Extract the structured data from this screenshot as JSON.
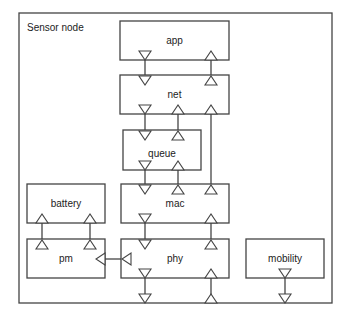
{
  "title": "Sensor node",
  "modules": {
    "app": "app",
    "net": "net",
    "queue": "queue",
    "mac": "mac",
    "phy": "phy",
    "battery": "battery",
    "pm": "pm",
    "mobility": "mobility"
  },
  "colors": {
    "stroke": "#444444",
    "background": "#ffffff",
    "text": "#222222"
  }
}
